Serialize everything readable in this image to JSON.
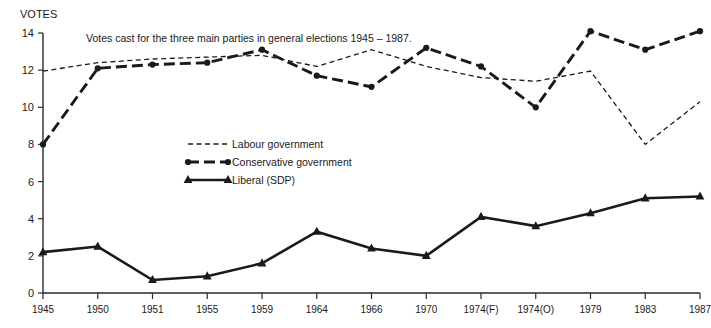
{
  "chart_data": {
    "type": "line",
    "title": "Votes cast for the three main parties in general elections 1945 – 1987.",
    "xlabel": "",
    "ylabel": "VOTES",
    "ylim": [
      0,
      14
    ],
    "yticks": [
      0,
      2,
      4,
      6,
      8,
      10,
      12,
      14
    ],
    "grid": false,
    "legend_position": "inside-center-left",
    "categories": [
      "1945",
      "1950",
      "1951",
      "1955",
      "1959",
      "1964",
      "1966",
      "1970",
      "1974(F)",
      "1974(O)",
      "1979",
      "1983",
      "1987"
    ],
    "series": [
      {
        "name": "Labour government",
        "style": "dotted",
        "marker": "none",
        "color": "#1a1a1a",
        "values": [
          11.95,
          12.4,
          12.6,
          12.7,
          12.8,
          12.2,
          13.1,
          12.2,
          11.6,
          11.4,
          11.95,
          8.0,
          10.3
        ]
      },
      {
        "name": "Conservative government",
        "style": "dashed",
        "marker": "circle",
        "color": "#1a1a1a",
        "values": [
          8.0,
          12.1,
          12.3,
          12.4,
          13.1,
          11.7,
          11.1,
          13.2,
          12.2,
          10.0,
          14.1,
          13.1,
          14.1
        ]
      },
      {
        "name": "Liberal (SDP)",
        "style": "solid",
        "marker": "triangle",
        "color": "#1a1a1a",
        "values": [
          2.2,
          2.5,
          0.7,
          0.9,
          1.6,
          3.3,
          2.4,
          2.0,
          4.1,
          3.6,
          4.3,
          5.1,
          5.2
        ]
      }
    ]
  },
  "legend": {
    "items": [
      {
        "label": "Labour government"
      },
      {
        "label": "Conservative government"
      },
      {
        "label": "Liberal (SDP)"
      }
    ]
  }
}
